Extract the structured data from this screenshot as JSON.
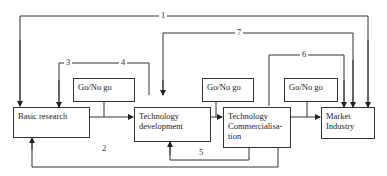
{
  "diagram": {
    "nodes": {
      "basic_research": "Basic research",
      "tech_dev_1": "Technology",
      "tech_dev_2": "development",
      "tech_comm_1": "Technology",
      "tech_comm_2": "Commercialisa-",
      "tech_comm_3": "tion",
      "market_1": "Market",
      "market_2": "Industry"
    },
    "gates": {
      "gate1": "Go/No go",
      "gate2": "Go/No go",
      "gate3": "Go/No go"
    },
    "links": {
      "l1": "1",
      "l2": "2",
      "l3": "3",
      "l4": "4",
      "l5": "5",
      "l6": "6",
      "l7": "7"
    },
    "colors": {
      "line": "#333333",
      "background": "#ffffff"
    }
  }
}
